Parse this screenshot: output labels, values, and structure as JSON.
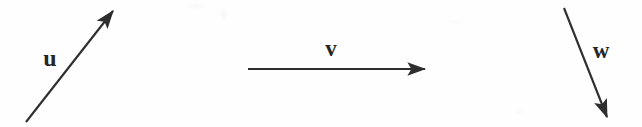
{
  "figure": {
    "kind": "vector-diagram",
    "background_color": "#fefefe",
    "stroke_color": "#2e2e2e",
    "label_color": "#262626",
    "width": 642,
    "height": 127,
    "caption": ""
  },
  "vectors": [
    {
      "id": "u",
      "label": "u",
      "direction": "up-right",
      "tail": {
        "x": 26,
        "y": 122
      },
      "tip": {
        "x": 113,
        "y": 11
      },
      "label_position": {
        "x": 50,
        "y": 58
      },
      "stroke_width": 2.1,
      "arrowhead": "solid-triangle"
    },
    {
      "id": "v",
      "label": "v",
      "direction": "right",
      "tail": {
        "x": 248,
        "y": 69
      },
      "tip": {
        "x": 425,
        "y": 69
      },
      "label_position": {
        "x": 331,
        "y": 48
      },
      "stroke_width": 2.1,
      "arrowhead": "solid-triangle"
    },
    {
      "id": "w",
      "label": "w",
      "direction": "down-right",
      "tail": {
        "x": 564,
        "y": 8
      },
      "tip": {
        "x": 607,
        "y": 117
      },
      "label_position": {
        "x": 601,
        "y": 50
      },
      "stroke_width": 2.1,
      "arrowhead": "solid-triangle"
    }
  ]
}
